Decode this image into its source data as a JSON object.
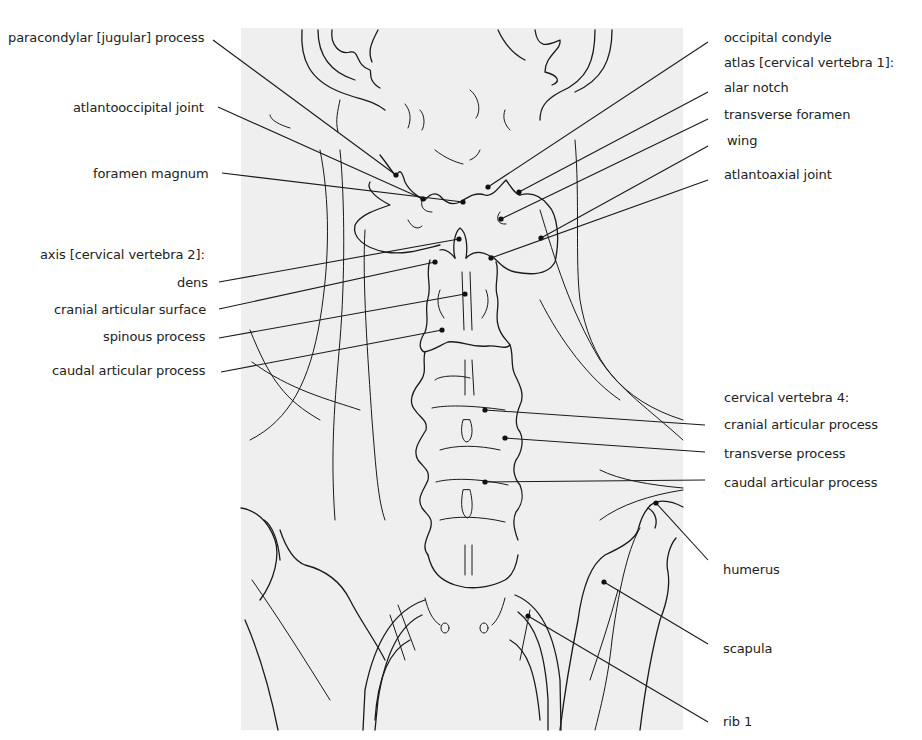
{
  "figure": {
    "background_panel_color": "#efefef",
    "line_color": "#1a1a1a"
  },
  "labels_left": [
    {
      "id": "paracondylar",
      "text": "paracondylar [jugular] process",
      "x": 8,
      "y": 30,
      "anchor": [
        213,
        40
      ],
      "target": [
        396,
        175
      ]
    },
    {
      "id": "atlantooccipital",
      "text": "atlantooccipital joint",
      "x": 73,
      "y": 100,
      "anchor": [
        218,
        107
      ],
      "target": [
        423,
        199
      ]
    },
    {
      "id": "foramen_magnum",
      "text": "foramen magnum",
      "x": 93,
      "y": 166,
      "anchor": [
        222,
        173
      ],
      "target": [
        463,
        202
      ]
    },
    {
      "id": "axis_header",
      "text": "axis [cervical vertebra 2]:",
      "x": 40,
      "y": 247,
      "anchor": null,
      "target": null
    },
    {
      "id": "dens",
      "text": "dens",
      "x": 177,
      "y": 275,
      "anchor": [
        219,
        282
      ],
      "target": [
        459,
        239
      ]
    },
    {
      "id": "cranial_articular_surface",
      "text": "cranial articular surface",
      "x": 54,
      "y": 302,
      "anchor": [
        219,
        309
      ],
      "target": [
        435,
        262
      ]
    },
    {
      "id": "spinous_process",
      "text": "spinous process",
      "x": 103,
      "y": 329,
      "anchor": [
        219,
        338
      ],
      "target": [
        465,
        294
      ]
    },
    {
      "id": "caudal_articular_process_c2",
      "text": "caudal articular process",
      "x": 52,
      "y": 363,
      "anchor": [
        221,
        372
      ],
      "target": [
        442,
        330
      ]
    }
  ],
  "labels_right": [
    {
      "id": "occipital_condyle",
      "text": "occipital condyle",
      "x": 724,
      "y": 30,
      "anchor": [
        708,
        42
      ],
      "target": [
        488,
        187
      ]
    },
    {
      "id": "atlas_header",
      "text": "atlas [cervical  vertebra 1]:",
      "x": 724,
      "y": 55,
      "anchor": null,
      "target": null
    },
    {
      "id": "alar_notch",
      "text": "alar notch",
      "x": 724,
      "y": 80,
      "anchor": [
        708,
        92
      ],
      "target": [
        519,
        192
      ]
    },
    {
      "id": "transverse_foramen",
      "text": "transverse foramen",
      "x": 724,
      "y": 107,
      "anchor": [
        708,
        119
      ],
      "target": [
        501,
        219
      ]
    },
    {
      "id": "wing",
      "text": "wing",
      "x": 727,
      "y": 133,
      "anchor": [
        708,
        146
      ],
      "target": [
        541,
        238
      ]
    },
    {
      "id": "atlantoaxial_joint",
      "text": "atlantoaxial joint",
      "x": 724,
      "y": 167,
      "anchor": [
        708,
        180
      ],
      "target": [
        491,
        258
      ]
    },
    {
      "id": "cv4_header",
      "text": "cervical vertebra 4:",
      "x": 724,
      "y": 390,
      "anchor": null,
      "target": null
    },
    {
      "id": "cranial_articular_process_c4",
      "text": "cranial articular process",
      "x": 724,
      "y": 417,
      "anchor": [
        705,
        425
      ],
      "target": [
        485,
        410
      ]
    },
    {
      "id": "transverse_process_c4",
      "text": "transverse process",
      "x": 724,
      "y": 446,
      "anchor": [
        705,
        452
      ],
      "target": [
        505,
        438
      ]
    },
    {
      "id": "caudal_articular_process_c4",
      "text": "caudal articular process",
      "x": 724,
      "y": 475,
      "anchor": [
        705,
        480
      ],
      "target": [
        485,
        482
      ]
    },
    {
      "id": "humerus",
      "text": "humerus",
      "x": 723,
      "y": 562,
      "anchor": [
        708,
        560
      ],
      "target": [
        656,
        503
      ]
    },
    {
      "id": "scapula",
      "text": "scapula",
      "x": 723,
      "y": 641,
      "anchor": [
        708,
        644
      ],
      "target": [
        604,
        582
      ]
    },
    {
      "id": "rib_1",
      "text": "rib 1",
      "x": 723,
      "y": 714,
      "anchor": [
        708,
        722
      ],
      "target": [
        528,
        616
      ]
    }
  ]
}
